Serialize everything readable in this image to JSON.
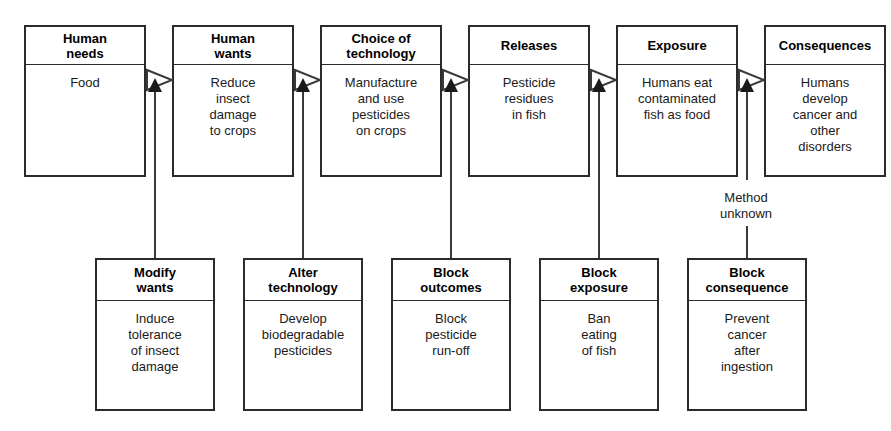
{
  "diagram": {
    "background_color": "#ffffff",
    "line_color": "#3a3a3a",
    "text_color": "#1a1a1a"
  },
  "chain": {
    "nodes": [
      {
        "header": "Human\nneeds",
        "body": "Food"
      },
      {
        "header": "Human\nwants",
        "body": "Reduce\ninsect\ndamage\nto crops"
      },
      {
        "header": "Choice of\ntechnology",
        "body": "Manufacture\nand use\npesticides\non crops"
      },
      {
        "header": "Releases",
        "body": "Pesticide\nresidues\nin fish"
      },
      {
        "header": "Exposure",
        "body": "Humans eat\ncontaminated\nfish as food"
      },
      {
        "header": "Consequences",
        "body": "Humans\ndevelop\ncancer and\nother\ndisorders"
      }
    ]
  },
  "interventions": {
    "nodes": [
      {
        "header": "Modify\nwants",
        "body": "Induce\ntolerance\nof insect\ndamage"
      },
      {
        "header": "Alter\ntechnology",
        "body": "Develop\nbiodegradable\npesticides"
      },
      {
        "header": "Block\noutcomes",
        "body": "Block\npesticide\nrun-off"
      },
      {
        "header": "Block\nexposure",
        "body": "Ban\neating\nof fish"
      },
      {
        "header": "Block\nconsequence",
        "body": "Prevent\ncancer\nafter\ningestion"
      }
    ]
  },
  "edge_labels": [
    {
      "text": "Method\nunknown"
    }
  ],
  "icons": {
    "flow_arrow": "hollow-right-triangle-icon",
    "intervention_arrow": "solid-up-triangle-icon"
  }
}
